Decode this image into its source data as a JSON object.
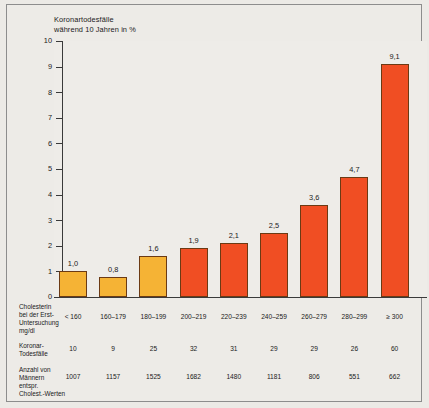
{
  "chart_data": {
    "type": "bar",
    "title": "Koronartodesfälle\nwährend 10 Jahren in %",
    "xlabel": "",
    "ylabel": "",
    "ylim": [
      0,
      10
    ],
    "yticks": [
      "0",
      "1",
      "2",
      "3",
      "4",
      "5",
      "6",
      "7",
      "8",
      "9",
      "10"
    ],
    "grid": false,
    "legend": "none",
    "categories": [
      "< 160",
      "160–179",
      "180–199",
      "200–219",
      "220–239",
      "240–259",
      "260–279",
      "280–299",
      "≥ 300"
    ],
    "values": [
      1.0,
      0.8,
      1.6,
      1.9,
      2.1,
      2.5,
      3.6,
      4.7,
      9.1
    ],
    "value_labels": [
      "1,0",
      "0,8",
      "1,6",
      "1,9",
      "2,1",
      "2,5",
      "3,6",
      "4,7",
      "9,1"
    ],
    "bar_colors": [
      "#f5b335",
      "#f5b335",
      "#f5b335",
      "#f04e23",
      "#f04e23",
      "#f04e23",
      "#f04e23",
      "#f04e23",
      "#f04e23"
    ],
    "series": [
      {
        "name": "Koronartodesfälle während 10 Jahren in %",
        "values": [
          1.0,
          0.8,
          1.6,
          1.9,
          2.1,
          2.5,
          3.6,
          4.7,
          9.1
        ]
      }
    ]
  },
  "table": {
    "rows": [
      {
        "label": "Cholesterin\nbei der Erst-\nUntersuchung\nmg/dl",
        "values": [
          "< 160",
          "160–179",
          "180–199",
          "200–219",
          "220–239",
          "240–259",
          "260–279",
          "280–299",
          "≥ 300"
        ]
      },
      {
        "label": "Koronar-\nTodesfälle",
        "values": [
          "10",
          "9",
          "25",
          "32",
          "31",
          "29",
          "29",
          "26",
          "60"
        ]
      },
      {
        "label": "Anzahl von\nMännern\nentspr.\nCholest.-Werten",
        "values": [
          "1007",
          "1157",
          "1525",
          "1682",
          "1480",
          "1181",
          "806",
          "551",
          "662"
        ]
      }
    ]
  },
  "colors": {
    "bar_yellow": "#f5b335",
    "bar_red": "#f04e23",
    "bar_outline": "#6b3a14",
    "axis": "#3a3a3a",
    "background": "#eeece8"
  }
}
